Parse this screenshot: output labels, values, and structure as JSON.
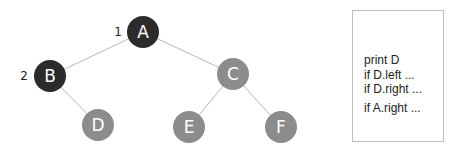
{
  "tree": {
    "edge_color": "#b8b8b8",
    "visited_color": "#2b2b2b",
    "unvisited_color": "#8c8c8c",
    "nodes": [
      {
        "id": "A",
        "label": "A",
        "cx": 143,
        "cy": 32,
        "state": "visited",
        "order": "1"
      },
      {
        "id": "B",
        "label": "B",
        "cx": 50,
        "cy": 76,
        "state": "visited",
        "order": "2"
      },
      {
        "id": "C",
        "label": "C",
        "cx": 233,
        "cy": 74,
        "state": "unvisited"
      },
      {
        "id": "D",
        "label": "D",
        "cx": 98,
        "cy": 125,
        "state": "unvisited"
      },
      {
        "id": "E",
        "label": "E",
        "cx": 189,
        "cy": 127,
        "state": "unvisited"
      },
      {
        "id": "F",
        "label": "F",
        "cx": 281,
        "cy": 127,
        "state": "unvisited"
      }
    ],
    "edges": [
      [
        "A",
        "B"
      ],
      [
        "A",
        "C"
      ],
      [
        "B",
        "D"
      ],
      [
        "C",
        "E"
      ],
      [
        "C",
        "F"
      ]
    ]
  },
  "call_stack": {
    "lines": [
      "print D",
      "if D.left ...",
      "if D.right ...",
      "if A.right ..."
    ]
  }
}
